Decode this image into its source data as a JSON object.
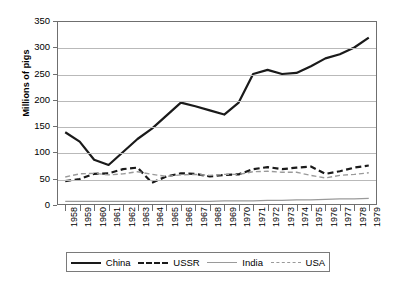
{
  "chart_data": {
    "type": "line",
    "title": "",
    "xlabel": "",
    "ylabel": "Millions of pigs",
    "ylim": [
      0,
      350
    ],
    "yticks": [
      0,
      50,
      100,
      150,
      200,
      250,
      300,
      350
    ],
    "grid": true,
    "legend_position": "bottom",
    "x": [
      1958,
      1959,
      1960,
      1961,
      1962,
      1963,
      1964,
      1965,
      1966,
      1967,
      1968,
      1969,
      1970,
      1971,
      1972,
      1973,
      1974,
      1975,
      1976,
      1977,
      1978,
      1979
    ],
    "categories": [
      "1958",
      "1959",
      "1960",
      "1961",
      "1962",
      "1963",
      "1964",
      "1965",
      "1966",
      "1967",
      "1968",
      "1969",
      "1970",
      "1971",
      "1972",
      "1973",
      "1974",
      "1975",
      "1976",
      "1977",
      "1978",
      "1979"
    ],
    "series": [
      {
        "name": "China",
        "color": "#1a1a1a",
        "style": "solid",
        "width": 2.2,
        "values": [
          138,
          120,
          85,
          75,
          100,
          125,
          145,
          170,
          195,
          188,
          180,
          172,
          195,
          250,
          258,
          250,
          252,
          265,
          280,
          288,
          301,
          320
        ]
      },
      {
        "name": "USSR",
        "color": "#1a1a1a",
        "style": "dashed",
        "width": 2.2,
        "values": [
          44,
          48,
          58,
          59,
          67,
          70,
          41,
          53,
          59,
          58,
          53,
          56,
          57,
          67,
          71,
          67,
          70,
          72,
          58,
          63,
          70,
          74
        ]
      },
      {
        "name": "India",
        "color": "#9a9a9a",
        "style": "solid",
        "width": 1.3,
        "values": [
          5,
          5,
          5,
          5,
          5,
          5,
          5,
          5,
          5,
          5,
          5,
          6,
          6,
          6,
          7,
          7,
          8,
          8,
          9,
          10,
          10,
          11
        ]
      },
      {
        "name": "USA",
        "color": "#9a9a9a",
        "style": "dashed",
        "width": 1.4,
        "values": [
          52,
          58,
          59,
          56,
          58,
          62,
          57,
          53,
          56,
          57,
          55,
          57,
          57,
          62,
          63,
          61,
          61,
          55,
          50,
          55,
          57,
          60
        ]
      }
    ]
  },
  "legend": {
    "items": [
      {
        "label": "China"
      },
      {
        "label": "USSR"
      },
      {
        "label": "India"
      },
      {
        "label": "USA"
      }
    ]
  }
}
